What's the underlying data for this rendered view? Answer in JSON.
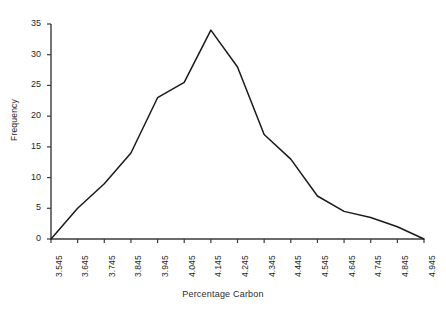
{
  "chart_data": {
    "type": "line",
    "title": "",
    "subtitle": "",
    "xlabel": "Percentage Carbon",
    "ylabel": "Frequency",
    "grid": false,
    "legend": "none",
    "xlim": [
      3.545,
      4.945
    ],
    "ylim": [
      0,
      35
    ],
    "x_tick_labels": [
      "3.545",
      "3.645",
      "3.745",
      "3.845",
      "3.945",
      "4.045",
      "4.145",
      "4.245",
      "4.345",
      "4.445",
      "4.545",
      "4.645",
      "4.745",
      "4.845",
      "4.945"
    ],
    "y_tick_labels": [
      "0",
      "5",
      "10",
      "15",
      "20",
      "25",
      "30",
      "35"
    ],
    "y_ticks": [
      0,
      5,
      10,
      15,
      20,
      25,
      30,
      35
    ],
    "categories": [
      3.545,
      3.645,
      3.745,
      3.845,
      3.945,
      4.045,
      4.145,
      4.245,
      4.345,
      4.445,
      4.545,
      4.645,
      4.745,
      4.845,
      4.945
    ],
    "values": [
      0,
      5,
      9,
      14,
      23,
      25.5,
      34,
      28,
      17,
      13,
      7,
      4.5,
      3.5,
      2,
      0
    ],
    "series": [
      {
        "name": "Frequency",
        "values": [
          0,
          5,
          9,
          14,
          23,
          25.5,
          34,
          28,
          17,
          13,
          7,
          4.5,
          3.5,
          2,
          0
        ],
        "color": "#1a1a1a"
      }
    ],
    "line_color": "#1a1a1a",
    "axis_color": "#3a3a3a",
    "background": "#ffffff"
  }
}
